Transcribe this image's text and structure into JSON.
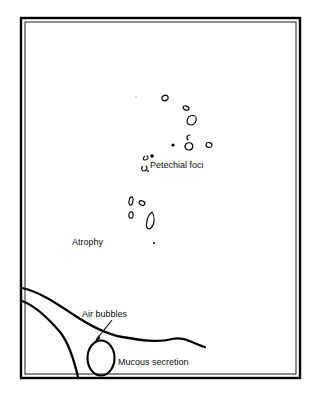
{
  "figure": {
    "frame": {
      "x": 21,
      "y": 18,
      "width": 279,
      "height": 360,
      "stroke": "#000000",
      "outer_width": 2.2,
      "inner_width": 1.0
    },
    "background_color": "#ffffff",
    "ink_color": "#000000"
  },
  "labels": [
    {
      "key": "petechial",
      "text": "Petechial foci",
      "x": 150,
      "y": 160
    },
    {
      "key": "atrophy",
      "text": "Atrophy",
      "x": 72,
      "y": 237
    },
    {
      "key": "air_bubbles",
      "text": "Air bubbles",
      "x": 82,
      "y": 309
    },
    {
      "key": "mucous",
      "text": "Mucous secretion",
      "x": 118,
      "y": 357
    }
  ],
  "annotations": {
    "leader_arrow": {
      "name": "air-bubbles-leader",
      "from_x": 112,
      "from_y": 320,
      "to_x": 95,
      "to_y": 341,
      "head_size": 5
    }
  },
  "lesions": {
    "description": "Small open ring-like petechial foci and atrophic patches",
    "petechial_foci": [
      {
        "cx": 165,
        "cy": 98,
        "rx": 3.2,
        "ry": 2.6,
        "rot": -25,
        "open": false
      },
      {
        "cx": 186,
        "cy": 108,
        "rx": 3.0,
        "ry": 2.0,
        "rot": 20,
        "open": false
      },
      {
        "cx": 192,
        "cy": 120,
        "rx": 4.4,
        "ry": 4.0,
        "rot": 0,
        "open": true
      },
      {
        "cx": 188,
        "cy": 137,
        "rx": 2.6,
        "ry": 2.6,
        "rot": 0,
        "open": true
      },
      {
        "cx": 188,
        "cy": 146,
        "rx": 3.6,
        "ry": 3.6,
        "rot": 0,
        "open": true
      },
      {
        "cx": 209,
        "cy": 145,
        "rx": 3.0,
        "ry": 2.4,
        "rot": 10,
        "open": false
      },
      {
        "cx": 146,
        "cy": 158,
        "rx": 2.4,
        "ry": 2.0,
        "rot": -30,
        "open": true
      },
      {
        "cx": 144,
        "cy": 168,
        "rx": 2.6,
        "ry": 2.2,
        "rot": -30,
        "open": true
      }
    ],
    "solid_dots": [
      {
        "cx": 173,
        "cy": 145,
        "r": 1.6
      },
      {
        "cx": 152,
        "cy": 156,
        "r": 1.8
      },
      {
        "cx": 148,
        "cy": 171,
        "r": 1.0
      },
      {
        "cx": 136,
        "cy": 97,
        "r": 0.7
      },
      {
        "cx": 154,
        "cy": 243,
        "r": 1.1
      }
    ],
    "atrophy_patches": [
      {
        "cx": 131,
        "cy": 201,
        "rx": 2.0,
        "ry": 4.2,
        "rot": 10
      },
      {
        "cx": 142,
        "cy": 203,
        "rx": 3.0,
        "ry": 2.2,
        "rot": 25
      },
      {
        "cx": 131,
        "cy": 215,
        "rx": 2.2,
        "ry": 3.4,
        "rot": 5
      },
      {
        "cx": 150,
        "cy": 219,
        "rx": 4.0,
        "ry": 6.5,
        "rot": 0,
        "shape": "leaf"
      }
    ]
  },
  "curves": {
    "upper_fold": "M 22,288 C 40,292 56,303 74,315 C 92,327 106,334 122,337 C 140,340 158,343 172,339 C 184,336 194,344 205,347",
    "lower_fold": "M 22,301 C 36,306 48,318 60,332 C 68,342 73,360 78,378",
    "bubble": {
      "cx": 101,
      "cy": 358,
      "rx": 13.5,
      "ry": 17.5
    }
  }
}
